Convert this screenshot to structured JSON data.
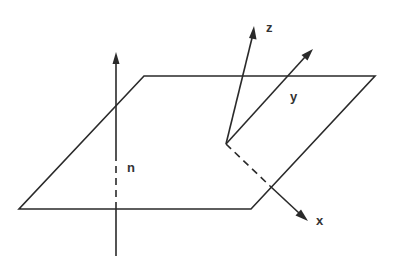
{
  "diagram": {
    "title": "",
    "colors": {
      "line": "#2a2a2a",
      "label": "#333333",
      "background": "#ffffff"
    },
    "plane": {
      "label": "",
      "corners": [
        [
          144,
          76
        ],
        [
          375,
          76
        ],
        [
          251,
          209
        ],
        [
          19,
          209
        ]
      ]
    },
    "normal": {
      "label": "n",
      "from": [
        116,
        256
      ],
      "to": [
        116,
        52
      ]
    },
    "frame": {
      "origin": [
        226,
        144
      ],
      "axes": [
        {
          "name": "x",
          "label": "x",
          "tip": [
            307,
            220
          ],
          "style": "dashed-then-solid"
        },
        {
          "name": "y",
          "label": "y",
          "tip": [
            312,
            50
          ],
          "style": "solid"
        },
        {
          "name": "z",
          "label": "z",
          "tip": [
            254,
            27
          ],
          "style": "solid"
        }
      ]
    }
  }
}
